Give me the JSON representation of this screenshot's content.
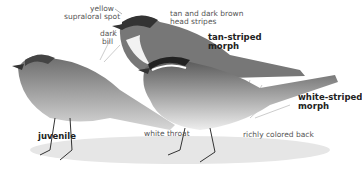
{
  "figure": {
    "labels": {
      "yellow_supraloral": [
        "yellow",
        "supraloral spot"
      ],
      "dark_bill": [
        "dark",
        "bill"
      ],
      "head_stripes": [
        "tan and dark brown",
        "head stripes"
      ],
      "tan_striped": [
        "tan-striped",
        "morph"
      ],
      "white_striped": [
        "white-striped",
        "morph"
      ],
      "juvenile": "juvenile",
      "white_throat": "white throat",
      "richly_colored_back": "richly colored back"
    }
  }
}
